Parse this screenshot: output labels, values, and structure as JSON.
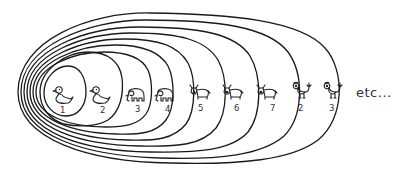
{
  "diagram": {
    "ink_color": "#1a1a1a",
    "background": "#ffffff",
    "items": [
      {
        "animal": "duck",
        "label": "1"
      },
      {
        "animal": "duck",
        "label": "2"
      },
      {
        "animal": "elephant",
        "label": "3"
      },
      {
        "animal": "elephant",
        "label": "4"
      },
      {
        "animal": "bull",
        "label": "5"
      },
      {
        "animal": "bull",
        "label": "6"
      },
      {
        "animal": "bull",
        "label": "7"
      },
      {
        "animal": "rooster",
        "label": "2"
      },
      {
        "animal": "rooster",
        "label": "3"
      }
    ],
    "continuation_text": "etc..."
  }
}
